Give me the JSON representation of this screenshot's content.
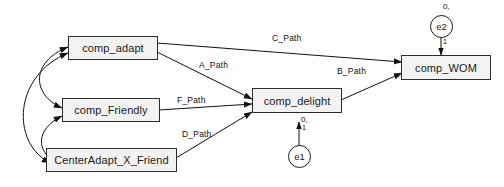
{
  "diagram": {
    "type": "sem-path-diagram",
    "background_color": "#ffffff",
    "node_fill": "#f2f2f2",
    "node_border": "#2b2b2b",
    "line_color": "#111111"
  },
  "nodes": [
    {
      "id": "comp_adapt",
      "label": "comp_adapt"
    },
    {
      "id": "comp_Friendly",
      "label": "comp_Friendly"
    },
    {
      "id": "CenterAdapt_X_Friend",
      "label": "CenterAdapt_X_Friend"
    },
    {
      "id": "comp_delight",
      "label": "comp_delight"
    },
    {
      "id": "comp_WOM",
      "label": "comp_WOM"
    }
  ],
  "errors": [
    {
      "id": "e1",
      "label": "e1",
      "mean_label": "0,",
      "loading_label": "1"
    },
    {
      "id": "e2",
      "label": "e2",
      "mean_label": "0,",
      "loading_label": "1"
    }
  ],
  "paths": [
    {
      "id": "a_path",
      "label": "A_Path",
      "from": "comp_adapt",
      "to": "comp_delight"
    },
    {
      "id": "c_path",
      "label": "C_Path",
      "from": "comp_adapt",
      "to": "comp_WOM"
    },
    {
      "id": "b_path",
      "label": "B_Path",
      "from": "comp_delight",
      "to": "comp_WOM"
    },
    {
      "id": "f_path",
      "label": "F_Path",
      "from": "comp_Friendly",
      "to": "comp_delight"
    },
    {
      "id": "d_path",
      "label": "D_Path",
      "from": "CenterAdapt_X_Friend",
      "to": "comp_delight"
    }
  ],
  "covariances": [
    {
      "id": "cov_adapt_friendly",
      "between": [
        "comp_adapt",
        "comp_Friendly"
      ]
    },
    {
      "id": "cov_friendly_center",
      "between": [
        "comp_Friendly",
        "CenterAdapt_X_Friend"
      ]
    },
    {
      "id": "cov_adapt_center",
      "between": [
        "comp_adapt",
        "CenterAdapt_X_Friend"
      ]
    }
  ]
}
